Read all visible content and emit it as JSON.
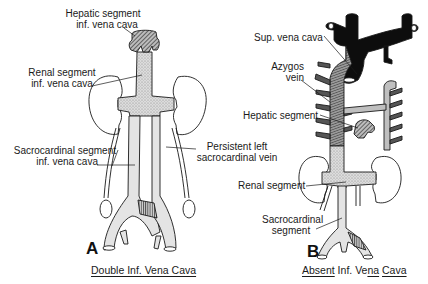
{
  "panels": {
    "a": {
      "letter": "A",
      "caption": "Double Inf. Vena Cava",
      "labels": {
        "hepatic_line1": "Hepatic segment",
        "hepatic_line2": "inf. vena cava",
        "renal_line1": "Renal segment",
        "renal_line2": "inf. vena cava",
        "sacro_line1": "Sacrocardinal segment",
        "sacro_line2": "inf. vena cava",
        "persistent_line1": "Persistent left",
        "persistent_line2": "sacrocardinal vein"
      }
    },
    "b": {
      "letter": "B",
      "caption_part1": "Absent",
      "caption_part2": " Inf. Ve",
      "caption_part3": "na",
      "caption_part4": " ",
      "caption_part5": "Cava",
      "caption": "Absent Inf. Vena Cava",
      "labels": {
        "svc": "Sup. vena cava",
        "azygos_line1": "Azygos",
        "azygos_line2": "vein",
        "hepatic": "Hepatic segment",
        "renal": "Renal segment",
        "sacro_line1": "Sacrocardinal",
        "sacro_line2": "segment"
      }
    }
  },
  "colors": {
    "ink": "#1a1a1a",
    "stipple_fill": "#d9d9d9",
    "light_fill": "#e6e6e6",
    "hatch_fill": "#8a8a8a",
    "black_vessel": "#0d0d0d"
  }
}
